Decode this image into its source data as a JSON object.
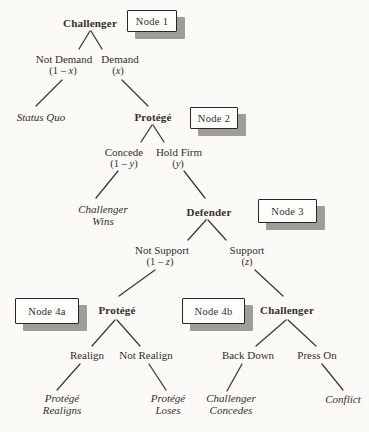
{
  "figure": {
    "colors": {
      "paper": "#fbfaf6",
      "text": "#332e28",
      "line": "#3e3a34",
      "box_fill": "#fdfdfb",
      "box_border": "#2a2520",
      "box_shadow": "#9e9d99"
    },
    "node_tags": {
      "node1": "Node 1",
      "node2": "Node 2",
      "node3": "Node 3",
      "node4a": "Node 4a",
      "node4b": "Node 4b"
    },
    "players": {
      "node1": "Challenger",
      "node2": "Protégé",
      "node3": "Defender",
      "node4a": "Protégé",
      "node4b": "Challenger"
    },
    "actions": {
      "not_demand": {
        "label": "Not Demand",
        "pre": "(1 – ",
        "var": "x",
        "post": ")"
      },
      "demand": {
        "label": "Demand",
        "pre": "(",
        "var": "x",
        "post": ")"
      },
      "concede": {
        "label": "Concede",
        "pre": "(1 – ",
        "var": "y",
        "post": ")"
      },
      "hold_firm": {
        "label": "Hold Firm",
        "pre": "(",
        "var": "y",
        "post": ")"
      },
      "not_support": {
        "label": "Not Support",
        "pre": "(1 – ",
        "var": "z",
        "post": ")"
      },
      "support": {
        "label": "Support",
        "pre": "(",
        "var": "z",
        "post": ")"
      },
      "realign": {
        "label": "Realign"
      },
      "not_realign": {
        "label": "Not Realign"
      },
      "back_down": {
        "label": "Back Down"
      },
      "press_on": {
        "label": "Press On"
      }
    },
    "outcomes": {
      "status_quo": {
        "line1": "Status Quo"
      },
      "challenger_wins": {
        "line1": "Challenger",
        "line2": "Wins"
      },
      "protege_realigns": {
        "line1": "Protégé",
        "line2": "Realigns"
      },
      "protege_loses": {
        "line1": "Protégé",
        "line2": "Loses"
      },
      "challenger_concedes": {
        "line1": "Challenger",
        "line2": "Concedes"
      },
      "conflict": {
        "line1": "Conflict"
      }
    }
  }
}
